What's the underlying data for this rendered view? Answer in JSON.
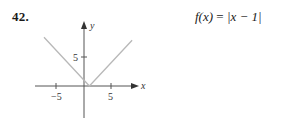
{
  "problem": {
    "number": "42.",
    "formula": {
      "lhs": "f(x)",
      "eq": "=",
      "rhs": "|x − 1|"
    }
  },
  "graph": {
    "axis_color": "#555555",
    "curve_color": "#b8b8b8",
    "x_axis_label": "x",
    "y_axis_label": "y",
    "x_ticks": [
      {
        "value": -5,
        "label": "−5"
      },
      {
        "value": 5,
        "label": "5"
      }
    ],
    "y_ticks": [
      {
        "value": 5,
        "label": "5"
      }
    ]
  },
  "chart_data": {
    "type": "line",
    "title": "f(x) = |x − 1|",
    "xlabel": "x",
    "ylabel": "y",
    "xlim": [
      -9,
      9.5
    ],
    "ylim": [
      -6,
      11
    ],
    "grid": false,
    "series": [
      {
        "name": "f(x) = |x − 1|",
        "x": [
          -7.4,
          1,
          8.9
        ],
        "y": [
          8.4,
          0,
          7.9
        ]
      }
    ],
    "x_tick_labels": [
      "−5",
      "5"
    ],
    "y_tick_labels": [
      "5"
    ]
  }
}
